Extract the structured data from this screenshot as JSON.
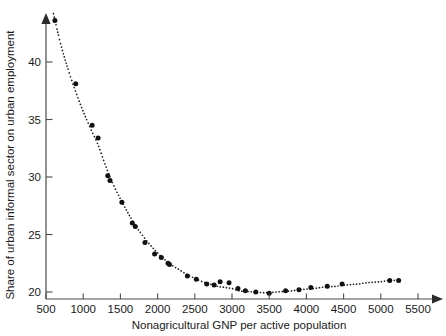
{
  "chart_data": {
    "type": "scatter",
    "title": "",
    "xlabel": "Nonagricultural GNP per active population",
    "ylabel": "Share of urban informal sector on urban employment",
    "xlim": [
      500,
      5600
    ],
    "ylim": [
      19.2,
      44.8
    ],
    "xticks": [
      500,
      1000,
      1500,
      2000,
      2500,
      3000,
      3500,
      4000,
      4500,
      5000,
      5500
    ],
    "xticklabels": [
      "500",
      "1000",
      "1500",
      "2000",
      "2500",
      "3000",
      "3500",
      "4000",
      "4500",
      "5000",
      "5500"
    ],
    "yticks": [
      20,
      25,
      30,
      35,
      40
    ],
    "yticklabels": [
      "20",
      "25",
      "30",
      "35",
      "40"
    ],
    "grid": false,
    "legend": null,
    "marker_style": "filled-circle",
    "fit_line_style": "dotted",
    "series": [
      {
        "name": "Urban informal sector share vs nonagricultural GNP",
        "points": [
          [
            620,
            43.6
          ],
          [
            900,
            38.1
          ],
          [
            1120,
            34.5
          ],
          [
            1200,
            33.4
          ],
          [
            1330,
            30.1
          ],
          [
            1360,
            29.7
          ],
          [
            1520,
            27.8
          ],
          [
            1660,
            26.0
          ],
          [
            1700,
            25.7
          ],
          [
            1830,
            24.3
          ],
          [
            1960,
            23.3
          ],
          [
            2050,
            23.0
          ],
          [
            2140,
            22.5
          ],
          [
            2160,
            22.4
          ],
          [
            2400,
            21.4
          ],
          [
            2520,
            21.1
          ],
          [
            2660,
            20.7
          ],
          [
            2760,
            20.6
          ],
          [
            2840,
            20.9
          ],
          [
            2960,
            20.8
          ],
          [
            3080,
            20.3
          ],
          [
            3180,
            20.1
          ],
          [
            3320,
            20.0
          ],
          [
            3500,
            19.9
          ],
          [
            3720,
            20.1
          ],
          [
            3900,
            20.2
          ],
          [
            4060,
            20.4
          ],
          [
            4280,
            20.5
          ],
          [
            4480,
            20.7
          ],
          [
            5120,
            21.0
          ],
          [
            5240,
            21.0
          ]
        ]
      }
    ],
    "fit_curve": [
      [
        600,
        44.2
      ],
      [
        700,
        41.5
      ],
      [
        800,
        39.3
      ],
      [
        900,
        37.4
      ],
      [
        1000,
        35.7
      ],
      [
        1100,
        34.2
      ],
      [
        1200,
        32.8
      ],
      [
        1300,
        31.0
      ],
      [
        1400,
        29.4
      ],
      [
        1500,
        28.1
      ],
      [
        1600,
        26.9
      ],
      [
        1700,
        25.8
      ],
      [
        1800,
        24.9
      ],
      [
        1900,
        24.1
      ],
      [
        2000,
        23.4
      ],
      [
        2100,
        22.8
      ],
      [
        2200,
        22.3
      ],
      [
        2300,
        21.9
      ],
      [
        2400,
        21.5
      ],
      [
        2500,
        21.2
      ],
      [
        2600,
        20.9
      ],
      [
        2700,
        20.7
      ],
      [
        2800,
        20.5
      ],
      [
        2900,
        20.4
      ],
      [
        3000,
        20.3
      ],
      [
        3100,
        20.1
      ],
      [
        3200,
        20.05
      ],
      [
        3300,
        20.0
      ],
      [
        3400,
        19.95
      ],
      [
        3500,
        19.95
      ],
      [
        3600,
        20.0
      ],
      [
        3700,
        20.05
      ],
      [
        3800,
        20.1
      ],
      [
        3900,
        20.2
      ],
      [
        4000,
        20.25
      ],
      [
        4100,
        20.3
      ],
      [
        4200,
        20.4
      ],
      [
        4300,
        20.45
      ],
      [
        4400,
        20.5
      ],
      [
        4500,
        20.6
      ],
      [
        4600,
        20.65
      ],
      [
        4700,
        20.7
      ],
      [
        4800,
        20.8
      ],
      [
        4900,
        20.85
      ],
      [
        5000,
        20.9
      ],
      [
        5100,
        21.0
      ],
      [
        5200,
        21.0
      ]
    ]
  }
}
